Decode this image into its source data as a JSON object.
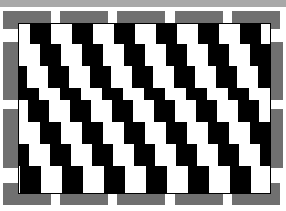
{
  "image": {
    "title": "Café wall illusion",
    "colors": {
      "border_bar": "#a8a8a8",
      "brick": "#707070",
      "dark": "#000000",
      "light": "#ffffff"
    }
  },
  "bricks": [
    {
      "x": 3,
      "y": 11,
      "w": 48,
      "h": 18
    },
    {
      "x": 60,
      "y": 11,
      "w": 48,
      "h": 18
    },
    {
      "x": 117,
      "y": 11,
      "w": 48,
      "h": 18
    },
    {
      "x": 175,
      "y": 11,
      "w": 48,
      "h": 18
    },
    {
      "x": 232,
      "y": 11,
      "w": 48,
      "h": 18
    },
    {
      "x": 3,
      "y": 183,
      "w": 48,
      "h": 22
    },
    {
      "x": 60,
      "y": 183,
      "w": 48,
      "h": 22
    },
    {
      "x": 117,
      "y": 183,
      "w": 48,
      "h": 22
    },
    {
      "x": 175,
      "y": 183,
      "w": 48,
      "h": 22
    },
    {
      "x": 232,
      "y": 183,
      "w": 48,
      "h": 22
    },
    {
      "x": 3,
      "y": 42,
      "w": 16,
      "h": 58
    },
    {
      "x": 3,
      "y": 109,
      "w": 16,
      "h": 59
    },
    {
      "x": 270,
      "y": 42,
      "w": 13,
      "h": 58
    },
    {
      "x": 270,
      "y": 109,
      "w": 13,
      "h": 59
    }
  ],
  "rows": [
    {
      "y": 0,
      "h": 20,
      "offset": -10
    },
    {
      "y": 20,
      "h": 22,
      "offset": 0
    },
    {
      "y": 42,
      "h": 22,
      "offset": 8
    },
    {
      "y": 64,
      "h": 12,
      "offset": 20
    },
    {
      "y": 76,
      "h": 22,
      "offset": -12
    },
    {
      "y": 98,
      "h": 22,
      "offset": 0
    },
    {
      "y": 120,
      "h": 22,
      "offset": 10
    },
    {
      "y": 142,
      "h": 27,
      "offset": 22
    }
  ],
  "tile": {
    "width": 21,
    "period": 42
  }
}
